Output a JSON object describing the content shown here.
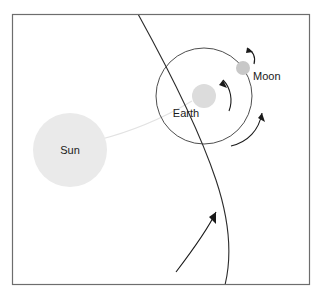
{
  "figure": {
    "background_color": "#ffffff",
    "frame": {
      "name": "diagram-border",
      "stroke_color": "#6d6d6d",
      "x": 12,
      "y": 14,
      "width": 298,
      "height": 271
    }
  },
  "bodies": [
    {
      "id": "sun",
      "label": "Sun",
      "color": "#eaeaea",
      "cx": 70,
      "cy": 150,
      "r": 37,
      "label_x": 70,
      "label_y": 154,
      "label_anchor": "middle"
    },
    {
      "id": "earth",
      "label": "Earth",
      "color": "#dcdcdc",
      "cx": 204,
      "cy": 96,
      "r": 12,
      "label_x": 186,
      "label_y": 117,
      "label_anchor": "middle"
    },
    {
      "id": "moon",
      "label": "Moon",
      "color": "#c8c8c8",
      "cx": 243,
      "cy": 68,
      "r": 7,
      "label_x": 253,
      "label_y": 80,
      "label_anchor": "start"
    }
  ],
  "orbits": [
    {
      "id": "moon-orbit",
      "name": "moon-orbit-circle",
      "description": "Circular orbit of the Moon around the Earth",
      "cx": 204,
      "cy": 96,
      "r": 48,
      "stroke": "#3a3a3a"
    },
    {
      "id": "earth-orbit",
      "name": "earth-orbit-arc",
      "description": "Large curved arc showing the Earth path around the Sun",
      "stroke": "#2b2b2b"
    }
  ],
  "connectors": [
    {
      "id": "sun-earth-ray",
      "name": "sun-to-earth-ray",
      "description": "Faint light ray from the Sun toward the Earth",
      "color": "#e2e2e2"
    }
  ],
  "motion_arrows": [
    {
      "id": "moon-spin-arrow",
      "name": "moon-rotation-arrow",
      "description": "Small curved arrow above the Moon indicating its rotation",
      "direction": "counterclockwise"
    },
    {
      "id": "earth-spin-arrow",
      "name": "earth-rotation-arrow",
      "description": "Curved arrow around the Earth indicating its rotation",
      "direction": "counterclockwise"
    },
    {
      "id": "moon-revolution-arrow",
      "name": "moon-revolution-arrow",
      "description": "Curved arrow along the Moon orbit indicating revolution around the Earth",
      "direction": "counterclockwise"
    },
    {
      "id": "earth-revolution-arrow",
      "name": "earth-revolution-arrow",
      "description": "Arrow along the large arc indicating the Earth travel direction around the Sun",
      "direction": "upward along orbit"
    }
  ]
}
